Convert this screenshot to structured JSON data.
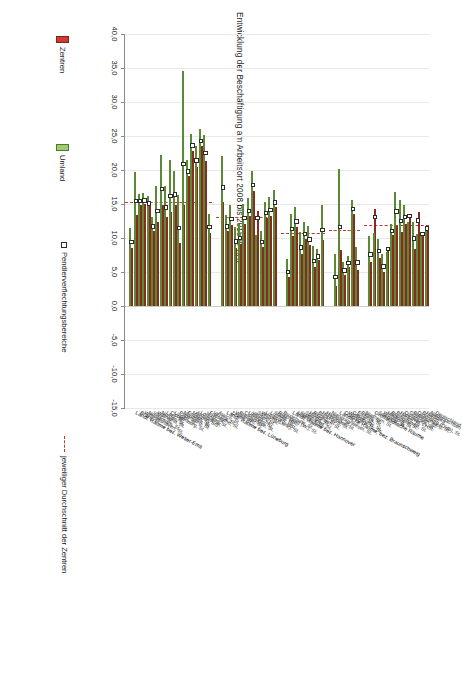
{
  "chart_data": {
    "type": "bar",
    "title": "Entwicklung der Beschäftigung am Arbeitsort 2008 bis 2015 in v.H.",
    "xlabel": "",
    "ylabel": "",
    "orientation": "horizontal",
    "xlim": [
      -15.0,
      40.0
    ],
    "xticks": [
      "-15,0",
      "-10,0",
      "-5,0",
      "0,0",
      "5,0",
      "10,0",
      "15,0",
      "20,0",
      "25,0",
      "30,0",
      "35,0",
      "40,0"
    ],
    "grid": true,
    "legend_position": "bottom",
    "series": [
      {
        "name": "Zentren",
        "color": "#cf3b30"
      },
      {
        "name": "Umland",
        "color": "#9ecb6d"
      },
      {
        "name": "Pendlerverflechtungsbereiche",
        "color": "#ffffff"
      },
      {
        "name": "jeweiliger Durchschnitt der Zentren",
        "color": "#c0392b"
      }
    ],
    "groups": [
      {
        "name": "Großstädtische Räume",
        "average": 11.9,
        "rows": [
          {
            "label": "Deutschland",
            "zentren": 11.4,
            "umland": 11.4,
            "marker": 11.4,
            "is_reference": true
          },
          {
            "label": "Niedersachsen",
            "zentren": 10.6,
            "umland": 10.6,
            "marker": 10.6,
            "is_reference": true
          },
          {
            "label": "Hamburg",
            "zentren": 13.8,
            "umland": 10.6,
            "marker": 12.6
          },
          {
            "label": "Bremen",
            "zentren": 8.4,
            "umland": 12.3,
            "marker": 9.9
          },
          {
            "label": "Oldenburg (Oldb), St.",
            "zentren": 13.6,
            "umland": 12.4,
            "marker": 13.2
          },
          {
            "label": "Braunschweig, St.",
            "zentren": 12.1,
            "umland": 14.8,
            "marker": 13.1
          },
          {
            "label": "Göttingen, St.",
            "zentren": 10.9,
            "umland": 15.6,
            "marker": 12.5
          },
          {
            "label": "Osnabrück, St.",
            "zentren": 11.8,
            "umland": 16.8,
            "marker": 13.9
          },
          {
            "label": "Hannover, LHSt.",
            "zentren": 10.4,
            "umland": 12.0,
            "marker": 11.0
          },
          {
            "label": "Bremen, St.",
            "zentren": 8.6,
            "umland": 8.0,
            "marker": 8.4
          },
          {
            "label": "Bremerhaven, St.",
            "zentren": 5.0,
            "umland": 7.7,
            "marker": 5.8
          },
          {
            "label": "Hildesheim, St.",
            "zentren": 7.1,
            "umland": 9.8,
            "marker": 8.1
          },
          {
            "label": "Wolfsburg, St.",
            "zentren": 14.2,
            "umland": 10.8,
            "marker": 13.1
          },
          {
            "label": "Salzgitter, St.",
            "zentren": 6.4,
            "umland": 10.3,
            "marker": 7.6
          }
        ]
      },
      {
        "name": "Ländliche Räume, bez. Braunschweig",
        "average": 11.2,
        "rows": [
          {
            "label": "Northeim, St.",
            "zentren": 5.3,
            "umland": 8.7,
            "marker": 6.4
          },
          {
            "label": "Peine, St.",
            "zentren": 13.6,
            "umland": 15.6,
            "marker": 14.3
          },
          {
            "label": "Einbeck, St.",
            "zentren": 5.8,
            "umland": 7.4,
            "marker": 6.3
          },
          {
            "label": "Goslar, St.",
            "zentren": 4.6,
            "umland": 6.5,
            "marker": 5.2
          },
          {
            "label": "Wolfenbüttel, St.",
            "zentren": 8.3,
            "umland": 20.1,
            "marker": 11.6
          },
          {
            "label": "Osterode a. H., St.",
            "zentren": 3.0,
            "umland": 7.6,
            "marker": 4.3
          }
        ]
      },
      {
        "name": "Ländl. Räume bez. Hannover",
        "average": 10.8,
        "rows": [
          {
            "label": "Nienburg/Weser, St.",
            "zentren": 9.7,
            "umland": 14.8,
            "marker": 11.2
          },
          {
            "label": "Hameln, St.",
            "zentren": 6.8,
            "umland": 8.4,
            "marker": 7.3
          },
          {
            "label": "Holzminden, St.",
            "zentren": 5.8,
            "umland": 8.8,
            "marker": 6.6
          },
          {
            "label": "Bückeburg, St.",
            "zentren": 8.9,
            "umland": 11.8,
            "marker": 9.8
          },
          {
            "label": "Rinteln, St.",
            "zentren": 9.9,
            "umland": 12.4,
            "marker": 10.6
          },
          {
            "label": "Hildesheim, St.",
            "zentren": 7.6,
            "umland": 10.9,
            "marker": 8.6
          },
          {
            "label": "Springe, St.",
            "zentren": 11.6,
            "umland": 14.5,
            "marker": 12.4
          },
          {
            "label": "Stadthagen, St.",
            "zentren": 10.3,
            "umland": 13.6,
            "marker": 11.3
          },
          {
            "label": "Alfeld (L.), St.",
            "zentren": 4.2,
            "umland": 6.9,
            "marker": 5.0
          }
        ]
      },
      {
        "name": "Ländl. Räume bez. Lüneburg",
        "average": 13.1,
        "rows": [
          {
            "label": "Buxtehude, St.",
            "zentren": 14.5,
            "umland": 17.1,
            "marker": 15.2
          },
          {
            "label": "Rotenburg (W.), St.",
            "zentren": 13.3,
            "umland": 16.1,
            "marker": 14.1
          },
          {
            "label": "Stade, HSt.",
            "zentren": 13.0,
            "umland": 15.3,
            "marker": 13.7
          },
          {
            "label": "Lüchow, St.",
            "zentren": 8.7,
            "umland": 11.0,
            "marker": 9.4
          },
          {
            "label": "Lüneburg, HSt.",
            "zentren": 14.0,
            "umland": 10.5,
            "marker": 12.9
          },
          {
            "label": "Winsen (Luhe), St.",
            "zentren": 16.9,
            "umland": 19.8,
            "marker": 17.8
          },
          {
            "label": "Soltau, St.",
            "zentren": 13.2,
            "umland": 15.9,
            "marker": 14.0
          },
          {
            "label": "Verden, St.",
            "zentren": 12.0,
            "umland": 15.0,
            "marker": 12.9
          },
          {
            "label": "Uelzen, St.",
            "zentren": 9.1,
            "umland": 12.0,
            "marker": 10.0
          },
          {
            "label": "Cuxhaven, St.",
            "zentren": 8.5,
            "umland": 11.6,
            "marker": 9.5
          },
          {
            "label": "Bremervörde, St.",
            "zentren": 11.9,
            "umland": 14.8,
            "marker": 12.8
          },
          {
            "label": "Walsrode, St.",
            "zentren": 11.0,
            "umland": 13.4,
            "marker": 11.7
          },
          {
            "label": "Zeven, St.",
            "zentren": 15.3,
            "umland": 22.1,
            "marker": 17.4
          }
        ]
      },
      {
        "name": "Ländl. Räume bez. Weser-Ems",
        "average": 15.3,
        "rows": [
          {
            "label": "Aurich, St.",
            "zentren": 10.8,
            "umland": 13.5,
            "marker": 11.6
          },
          {
            "label": "Vechta, St.",
            "zentren": 21.3,
            "umland": 25.2,
            "marker": 22.5
          },
          {
            "label": "Friesoythe, St.",
            "zentren": 23.6,
            "umland": 26.0,
            "marker": 24.3
          },
          {
            "label": "Jever, St.",
            "zentren": 20.4,
            "umland": 23.5,
            "marker": 21.4
          },
          {
            "label": "Löningen, St.",
            "zentren": 22.8,
            "umland": 25.3,
            "marker": 23.6
          },
          {
            "label": "Arnstadt, St.",
            "zentren": 19.1,
            "umland": 21.4,
            "marker": 19.8
          },
          {
            "label": "Meppen, SG",
            "zentren": 14.9,
            "umland": 34.5,
            "marker": 20.9
          },
          {
            "label": "Emden, St.",
            "zentren": 9.3,
            "umland": 16.3,
            "marker": 11.5
          },
          {
            "label": "Nordhorn, St.",
            "zentren": 14.8,
            "umland": 19.9,
            "marker": 16.4
          },
          {
            "label": "Papenburg, St.",
            "zentren": 13.8,
            "umland": 21.5,
            "marker": 16.2
          },
          {
            "label": "Lingen, St.",
            "zentren": 13.1,
            "umland": 17.7,
            "marker": 14.5
          },
          {
            "label": "Cloppenburg, St.",
            "zentren": 14.9,
            "umland": 22.2,
            "marker": 17.2
          },
          {
            "label": "Leer, St.",
            "zentren": 12.3,
            "umland": 17.7,
            "marker": 14.0
          },
          {
            "label": "Norden, St.",
            "zentren": 11.0,
            "umland": 13.1,
            "marker": 11.7
          },
          {
            "label": "Wittmund, St.",
            "zentren": 14.7,
            "umland": 16.2,
            "marker": 15.1
          },
          {
            "label": "Varel, St.",
            "zentren": 15.0,
            "umland": 16.6,
            "marker": 15.5
          },
          {
            "label": "Nordenham, St.",
            "zentren": 14.9,
            "umland": 16.4,
            "marker": 15.4
          },
          {
            "label": "Wilhelmshaven, St.",
            "zentren": 13.4,
            "umland": 19.7,
            "marker": 15.4
          },
          {
            "label": "Brake, St.",
            "zentren": 8.6,
            "umland": 11.4,
            "marker": 9.4
          }
        ]
      }
    ]
  },
  "legend": {
    "zentren": "Zentren",
    "umland": "Umland",
    "pendler": "Pendlerverflechtungsbereiche",
    "durchschnitt": "jeweiliger Durchschnitt der Zentren"
  },
  "colors": {
    "zentren": "#cf3b30",
    "umland": "#9ecb6d",
    "durchschnitt": "#c0392b",
    "marker_fill": "#ffffff",
    "grid": "#e8e8e8"
  }
}
